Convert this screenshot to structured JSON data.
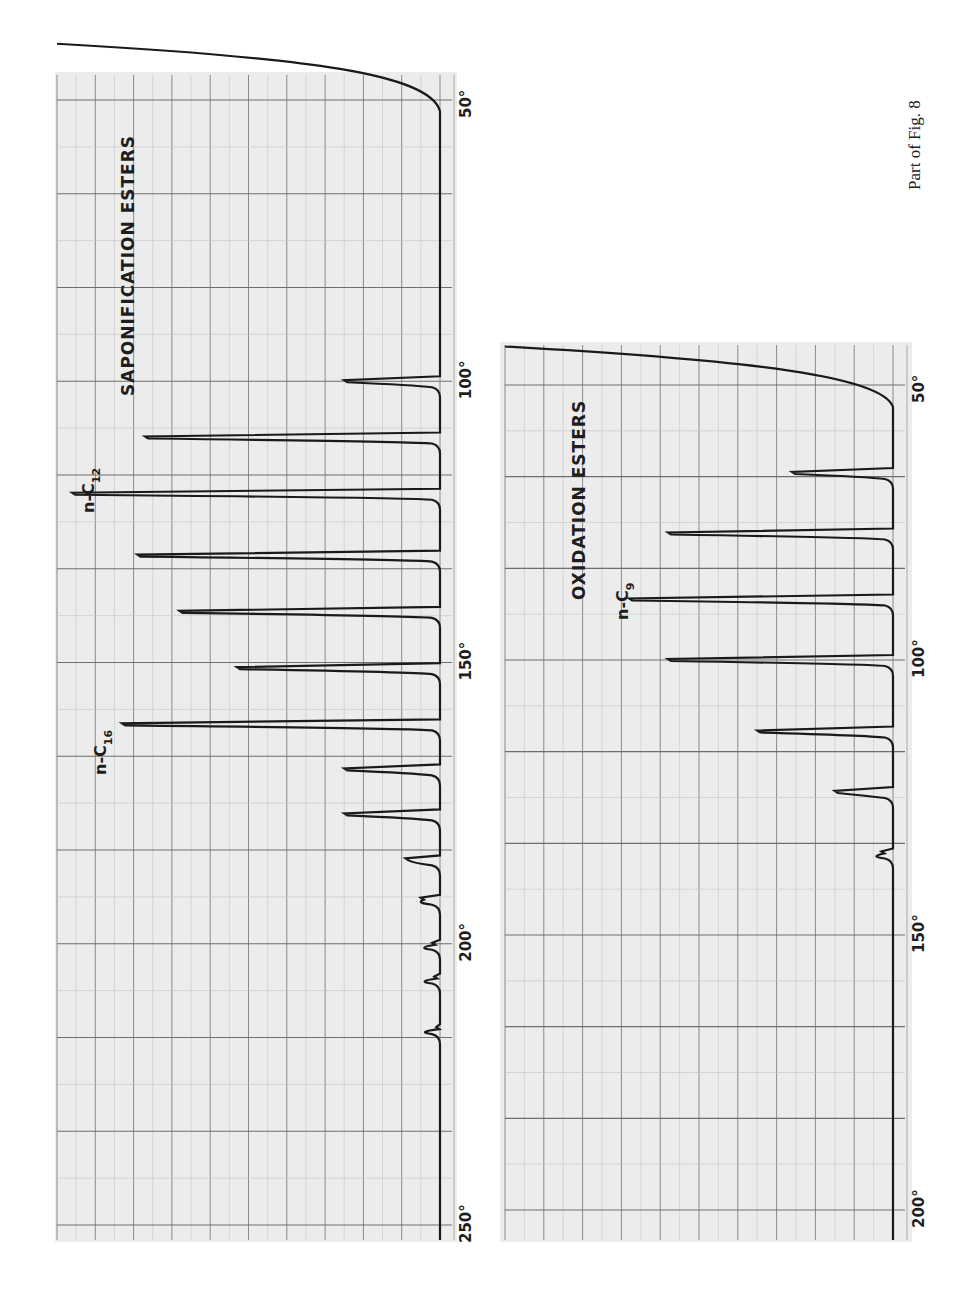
{
  "caption": "Part of Fig. 8",
  "chart_data": [
    {
      "type": "line",
      "title": "SAPONIFICATION ESTERS",
      "orientation": "rotated 90°: temperature axis runs vertically (top to bottom), detector deflection extends leftward from baseline",
      "xlabel": "Column temperature (°C)",
      "ylabel": "Detector response (% of full scale)",
      "x_ticks": [
        "50°",
        "100°",
        "150°",
        "200°",
        "250°"
      ],
      "xlim": [
        40,
        252
      ],
      "ylim": [
        0,
        100
      ],
      "grid": true,
      "annotations": [
        {
          "text": "n-C",
          "subscript": "12",
          "at_peak_index": 3
        },
        {
          "text": "n-C",
          "subscript": "16",
          "at_peak_index": 7
        }
      ],
      "peaks": [
        {
          "temp": 100,
          "height": 25
        },
        {
          "temp": 110,
          "height": 77
        },
        {
          "temp": 120,
          "height": 96,
          "label": "n-C12"
        },
        {
          "temp": 131,
          "height": 79
        },
        {
          "temp": 141,
          "height": 68
        },
        {
          "temp": 151,
          "height": 53
        },
        {
          "temp": 161,
          "height": 83,
          "label": "n-C16"
        },
        {
          "temp": 169,
          "height": 25
        },
        {
          "temp": 177,
          "height": 25
        },
        {
          "temp": 185,
          "height": 9
        },
        {
          "temp": 192,
          "height": 5
        },
        {
          "temp": 200,
          "height": 2
        },
        {
          "temp": 206,
          "height": 1.5
        },
        {
          "temp": 215,
          "height": 1
        }
      ],
      "solvent_front": {
        "start_temp": 40,
        "start_height": 100,
        "decay_to_baseline_temp": 52
      }
    },
    {
      "type": "line",
      "title": "OXIDATION ESTERS",
      "orientation": "rotated 90°: temperature axis runs vertically (top to bottom), detector deflection extends leftward from baseline",
      "xlabel": "Column temperature (°C)",
      "ylabel": "Detector response (% of full scale)",
      "x_ticks": [
        "50°",
        "100°",
        "150°",
        "200°"
      ],
      "xlim": [
        43,
        205
      ],
      "ylim": [
        0,
        100
      ],
      "grid": true,
      "annotations": [
        {
          "text": "n-C",
          "subscript": "9",
          "at_peak_index": 3
        }
      ],
      "peaks": [
        {
          "temp": 66,
          "height": 26
        },
        {
          "temp": 77,
          "height": 58
        },
        {
          "temp": 89,
          "height": 68,
          "label": "n-C9"
        },
        {
          "temp": 100,
          "height": 58
        },
        {
          "temp": 113,
          "height": 35
        },
        {
          "temp": 124,
          "height": 15
        },
        {
          "temp": 135,
          "height": 3
        }
      ],
      "solvent_front": {
        "start_temp": 43,
        "start_height": 100,
        "decay_to_baseline_temp": 54
      }
    }
  ],
  "charts": {
    "sap": {
      "title": "SAPONIFICATION ESTERS",
      "label1_main": "n-C",
      "label1_sub": "12",
      "label2_main": "n-C",
      "label2_sub": "16",
      "ticks": [
        "50°",
        "100°",
        "150°",
        "200°",
        "250°"
      ]
    },
    "ox": {
      "title": "OXIDATION ESTERS",
      "label1_main": "n-C",
      "label1_sub": "9",
      "ticks": [
        "50°",
        "100°",
        "150°",
        "200°"
      ]
    }
  },
  "colors": {
    "paper": "#ececec",
    "grid_major": "#8a8a8a",
    "grid_minor": "#c4c4c4",
    "trace": "#1a1a1a",
    "text": "#1e1e1e"
  }
}
